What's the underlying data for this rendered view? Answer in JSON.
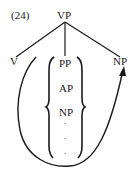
{
  "example_number": "(24)",
  "tree": {
    "root": "VP",
    "children": [
      {
        "label": "V"
      },
      {
        "label": "PP",
        "alternatives": [
          "PP",
          "AP",
          "NP",
          ".",
          ".",
          "."
        ]
      },
      {
        "label": "NP"
      }
    ]
  },
  "labels": {
    "root": "VP",
    "left": "V",
    "right": "NP",
    "brace_items": [
      "PP",
      "AP",
      "NP"
    ],
    "dots": [
      ".",
      ".",
      "."
    ]
  },
  "arrow": {
    "description": "curved arrow from position after V, looping below the braced alternatives, to the right NP",
    "color": "#1a1a1a"
  }
}
